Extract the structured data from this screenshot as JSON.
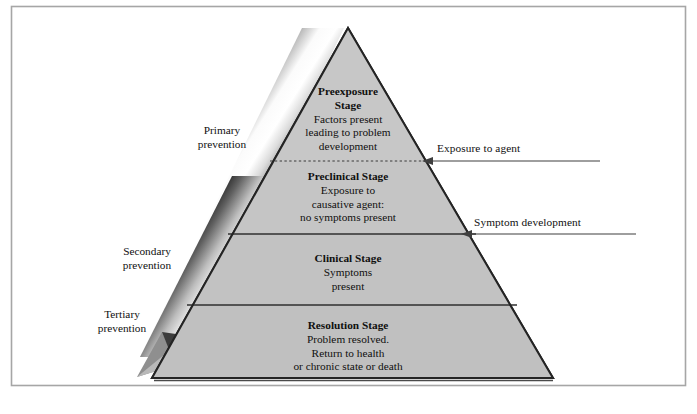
{
  "figure": {
    "type": "pyramid-diagram",
    "title_visible": false,
    "frame": {
      "border_color": "#9a9a9a",
      "background": "#ffffff"
    },
    "pyramid": {
      "fill_top": "#c9c9c9",
      "fill_bottom": "#c2c2c2",
      "outline_color": "#2b2b2b",
      "apex": {
        "x": 348,
        "y": 28
      },
      "base_left": {
        "x": 152,
        "y": 378
      },
      "base_right": {
        "x": 553,
        "y": 378
      }
    },
    "levels": [
      {
        "id": "preexposure",
        "title": "Preexposure\nStage",
        "title_lines": [
          "Preexposure",
          "Stage"
        ],
        "body_lines": [
          "Factors present",
          "leading to problem",
          "development"
        ],
        "divider_below": {
          "style": "dotted",
          "y": 161
        }
      },
      {
        "id": "preclinical",
        "title": "Preclinical Stage",
        "title_lines": [
          "Preclinical Stage"
        ],
        "body_lines": [
          "Exposure to",
          "causative agent:",
          "no symptoms present"
        ],
        "divider_below": {
          "style": "solid",
          "y": 234
        }
      },
      {
        "id": "clinical",
        "title": "Clinical Stage",
        "title_lines": [
          "Clinical Stage"
        ],
        "body_lines": [
          "Symptoms",
          "present"
        ],
        "divider_below": {
          "style": "solid",
          "y": 305
        }
      },
      {
        "id": "resolution",
        "title": "Resolution Stage",
        "title_lines": [
          "Resolution Stage"
        ],
        "body_lines": [
          "Problem resolved.",
          "Return to health",
          "or chronic state or death"
        ],
        "divider_below": null
      }
    ],
    "left_labels": [
      {
        "id": "primary",
        "lines": [
          "Primary",
          "prevention"
        ],
        "x": 185,
        "y": 131
      },
      {
        "id": "secondary",
        "lines": [
          "Secondary",
          "prevention"
        ],
        "x": 102,
        "y": 253
      },
      {
        "id": "tertiary",
        "lines": [
          "Tertiary",
          "prevention"
        ],
        "x": 82,
        "y": 316
      }
    ],
    "right_callouts": [
      {
        "id": "exposure-to-agent",
        "label": "Exposure to agent",
        "label_x": 437,
        "label_y": 143,
        "arrow_y": 161,
        "arrow_from_x": 600,
        "arrow_to_x": 424
      },
      {
        "id": "symptom-development",
        "label": "Symptom development",
        "label_x": 475,
        "label_y": 218,
        "arrow_y": 234,
        "arrow_from_x": 635,
        "arrow_to_x": 462
      }
    ],
    "prevention_band": {
      "id": "prevention-arrow-band",
      "description": "Wide diagonal gradient band with arrowhead pointing to lower left",
      "gradient_stops": [
        "#1c1c1c",
        "#cfcfcf",
        "#ffffff",
        "#f2f2f2",
        "#8e8e8e",
        "#2a2a2a"
      ],
      "arrowhead_tip": {
        "x": 137,
        "y": 377
      }
    }
  }
}
